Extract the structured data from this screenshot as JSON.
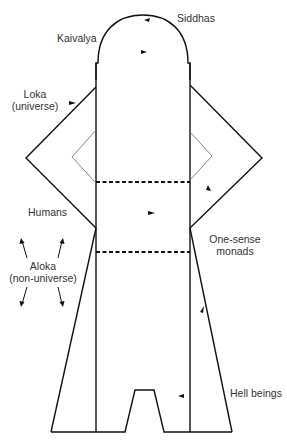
{
  "diagram": {
    "labels": {
      "siddhas": "Siddhas",
      "kaivalya": "Kaivalya",
      "loka_line1": "Loka",
      "loka_line2": "(universe)",
      "humans": "Humans",
      "aloka_line1": "Aloka",
      "aloka_line2": "(non-universe)",
      "one_sense_line1": "One-sense",
      "one_sense_line2": "monads",
      "hell_beings": "Hell beings"
    },
    "regions": [
      {
        "name": "Siddhas / Kaivalya dome",
        "top": "dome"
      },
      {
        "name": "Upper world (heavens)",
        "between": "dome to upper dashed line"
      },
      {
        "name": "Middle world (humans)",
        "between": "dashed lines"
      },
      {
        "name": "Lower world (hells)",
        "between": "lower dashed line to base"
      }
    ],
    "colors": {
      "stroke": "#111111",
      "inner_wing_stroke": "#777777",
      "text": "#333333",
      "background": "#ffffff"
    }
  }
}
